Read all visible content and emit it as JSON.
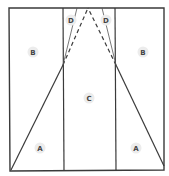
{
  "diagram": {
    "labels": {
      "b_left": "B",
      "b_right": "B",
      "c_center": "C",
      "a_left": "A",
      "a_right": "A",
      "d_left": "D",
      "d_right": "D"
    },
    "colors": {
      "line": "#3a3a3a",
      "label_background": "#ececec",
      "label_text": "#444444"
    }
  }
}
